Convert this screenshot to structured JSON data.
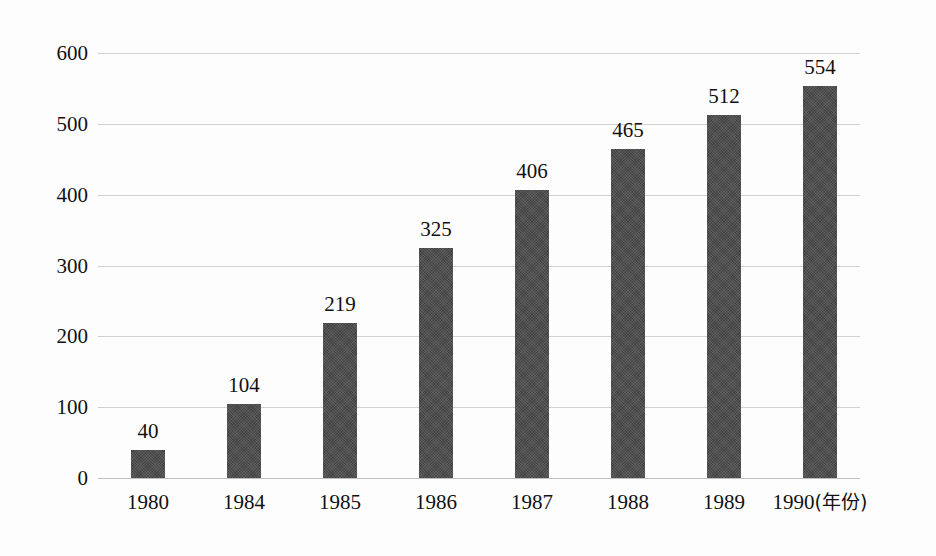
{
  "chart_data": {
    "type": "bar",
    "title": "",
    "subtitle": "",
    "xlabel": "年份",
    "ylabel": "",
    "categories": [
      "1980",
      "1984",
      "1985",
      "1986",
      "1987",
      "1988",
      "1989",
      "1990"
    ],
    "values": [
      40,
      104,
      219,
      325,
      406,
      465,
      512,
      554
    ],
    "data_labels": [
      "40",
      "104",
      "219",
      "325",
      "406",
      "465",
      "512",
      "554"
    ],
    "ylim": [
      0,
      600
    ],
    "ytick_labels": [
      "600",
      "500",
      "400",
      "300",
      "200",
      "100",
      "0"
    ],
    "ytick_values": [
      600,
      500,
      400,
      300,
      200,
      100,
      0
    ],
    "grid": "horizontal",
    "legend": "none",
    "bar_color": "#4b4b4b",
    "gridline_color": "#c9c9c9",
    "text_color": "#111111",
    "background_color": "#fdfdfd"
  },
  "axis": {
    "x_unit_label": "(年份)"
  }
}
